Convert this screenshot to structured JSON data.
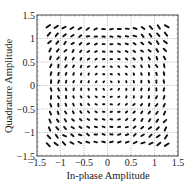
{
  "chart_data": {
    "type": "scatter",
    "title": "",
    "xlabel": "In-phase Amplitude",
    "ylabel": "Quadrature Amplitude",
    "xlim": [
      -1.5,
      1.5
    ],
    "ylim": [
      -1.5,
      1.5
    ],
    "xticks": [
      -1.5,
      -1,
      -0.5,
      0,
      0.5,
      1,
      1.5
    ],
    "yticks": [
      -1.5,
      -1,
      -0.5,
      0,
      0.5,
      1,
      1.5
    ],
    "xtick_labels": [
      "−1.5",
      "−1",
      "−0.5",
      "0",
      "0.5",
      "1",
      "1.5"
    ],
    "ytick_labels": [
      "−1.5",
      "−1",
      "−0.5",
      "0",
      "0.5",
      "1",
      "1.5"
    ],
    "grid": true,
    "grid_style": "dotted",
    "legend": null,
    "constellation": {
      "levels_per_axis": 16,
      "level_values": [
        -1.2,
        -1.04,
        -0.88,
        -0.72,
        -0.56,
        -0.4,
        -0.24,
        -0.08,
        0.08,
        0.24,
        0.4,
        0.56,
        0.72,
        0.88,
        1.04,
        1.2
      ],
      "distortion_k": 0.035,
      "smear_base": 0.012,
      "smear_growth": 0.035
    },
    "marker_color": "#111111"
  },
  "axes": {
    "x_axis_title": "In-phase Amplitude",
    "y_axis_title": "Quadrature Amplitude"
  }
}
